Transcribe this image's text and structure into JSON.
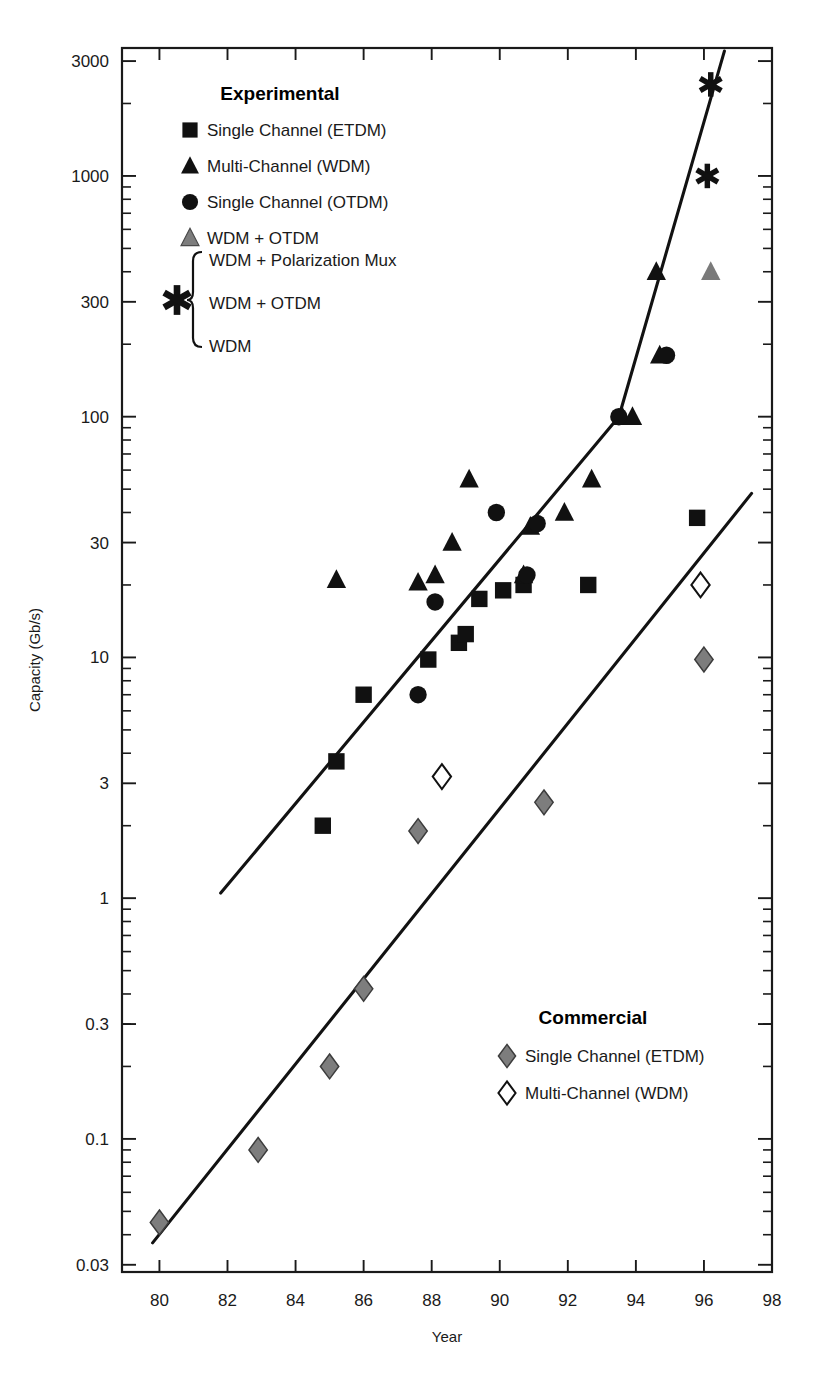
{
  "chart_data": {
    "type": "scatter",
    "title": "",
    "xlabel": "Year",
    "ylabel": "Capacity (Gb/s)",
    "yscale": "log",
    "xlim": [
      78.9,
      98
    ],
    "ylim": [
      0.028,
      3400
    ],
    "grid": false,
    "xticks": [
      "80",
      "82",
      "84",
      "86",
      "88",
      "90",
      "92",
      "94",
      "96",
      "98"
    ],
    "xtick_values": [
      80,
      82,
      84,
      86,
      88,
      90,
      92,
      94,
      96,
      98
    ],
    "yticks": [
      "0.03",
      "0.1",
      "0.3",
      "1",
      "3",
      "10",
      "30",
      "100",
      "300",
      "1000",
      "3000"
    ],
    "ytick_values": [
      0.03,
      0.1,
      0.3,
      1,
      3,
      10,
      30,
      100,
      300,
      1000,
      3000
    ],
    "legend_position": "upper-left and lower-right",
    "series": [
      {
        "name": "Single Channel (ETDM)",
        "group": "Experimental",
        "marker": "square",
        "fill": "#111111",
        "points": [
          {
            "x": 84.8,
            "y": 2.0
          },
          {
            "x": 85.2,
            "y": 3.7
          },
          {
            "x": 86.0,
            "y": 7.0
          },
          {
            "x": 87.9,
            "y": 9.8
          },
          {
            "x": 88.8,
            "y": 11.5
          },
          {
            "x": 89.0,
            "y": 12.5
          },
          {
            "x": 89.4,
            "y": 17.5
          },
          {
            "x": 90.1,
            "y": 19.0
          },
          {
            "x": 90.7,
            "y": 20.0
          },
          {
            "x": 92.6,
            "y": 20.0
          },
          {
            "x": 95.8,
            "y": 38.0
          }
        ]
      },
      {
        "name": "Multi-Channel (WDM)",
        "group": "Experimental",
        "marker": "triangle",
        "fill": "#111111",
        "points": [
          {
            "x": 85.2,
            "y": 21.0
          },
          {
            "x": 87.6,
            "y": 20.5
          },
          {
            "x": 88.1,
            "y": 22.0
          },
          {
            "x": 88.6,
            "y": 30.0
          },
          {
            "x": 89.1,
            "y": 55.0
          },
          {
            "x": 90.7,
            "y": 22.0
          },
          {
            "x": 90.9,
            "y": 35.0
          },
          {
            "x": 91.9,
            "y": 40.0
          },
          {
            "x": 92.7,
            "y": 55.0
          },
          {
            "x": 93.6,
            "y": 100.0
          },
          {
            "x": 93.9,
            "y": 100.0
          },
          {
            "x": 94.6,
            "y": 400.0
          },
          {
            "x": 94.7,
            "y": 180.0
          }
        ]
      },
      {
        "name": "Single Channel (OTDM)",
        "group": "Experimental",
        "marker": "circle",
        "fill": "#111111",
        "points": [
          {
            "x": 87.6,
            "y": 7.0
          },
          {
            "x": 88.1,
            "y": 17.0
          },
          {
            "x": 89.9,
            "y": 40.0
          },
          {
            "x": 90.8,
            "y": 22.0
          },
          {
            "x": 91.1,
            "y": 36.0
          },
          {
            "x": 93.5,
            "y": 100.0
          },
          {
            "x": 94.9,
            "y": 180.0
          }
        ]
      },
      {
        "name": "WDM + OTDM",
        "group": "Experimental",
        "marker": "triangle",
        "fill": "#7a7a7a",
        "points": [
          {
            "x": 96.2,
            "y": 400.0
          }
        ]
      },
      {
        "name": "WDM + Polarization Mux / WDM + OTDM / WDM",
        "group": "Experimental",
        "marker": "star",
        "fill": "#111111",
        "points": [
          {
            "x": 96.2,
            "y": 2400.0
          },
          {
            "x": 96.1,
            "y": 1000.0
          }
        ]
      },
      {
        "name": "Single Channel (ETDM)",
        "group": "Commercial",
        "marker": "diamond",
        "fill": "#7d7d7d",
        "points": [
          {
            "x": 80.0,
            "y": 0.045
          },
          {
            "x": 82.9,
            "y": 0.09
          },
          {
            "x": 85.0,
            "y": 0.2
          },
          {
            "x": 86.0,
            "y": 0.42
          },
          {
            "x": 87.6,
            "y": 1.9
          },
          {
            "x": 91.3,
            "y": 2.5
          },
          {
            "x": 96.0,
            "y": 9.8
          }
        ]
      },
      {
        "name": "Multi-Channel (WDM)",
        "group": "Commercial",
        "marker": "diamond-open",
        "fill": "#ffffff",
        "points": [
          {
            "x": 88.3,
            "y": 3.2
          },
          {
            "x": 95.9,
            "y": 20.0
          }
        ]
      }
    ],
    "trend_lines": [
      {
        "name": "experimental-trend",
        "segments": [
          {
            "x1": 81.8,
            "y1": 1.05,
            "x2": 93.5,
            "y2": 100.0
          },
          {
            "x1": 93.5,
            "y1": 100.0,
            "x2": 96.6,
            "y2": 3300.0
          }
        ]
      },
      {
        "name": "commercial-trend",
        "segments": [
          {
            "x1": 79.8,
            "y1": 0.037,
            "x2": 97.4,
            "y2": 48.0
          }
        ]
      }
    ]
  },
  "legend_experimental": {
    "title": "Experimental",
    "items": [
      {
        "marker": "square",
        "label": "Single Channel (ETDM)"
      },
      {
        "marker": "triangle",
        "label": "Multi-Channel (WDM)"
      },
      {
        "marker": "circle",
        "label": "Single Channel (OTDM)"
      },
      {
        "marker": "triangle-gray",
        "label": "WDM + OTDM"
      }
    ],
    "star_group": {
      "marker": "star",
      "lines": [
        "WDM + Polarization Mux",
        "WDM + OTDM",
        "WDM"
      ]
    }
  },
  "legend_commercial": {
    "title": "Commercial",
    "items": [
      {
        "marker": "diamond-gray",
        "label": "Single Channel (ETDM)"
      },
      {
        "marker": "diamond-open",
        "label": "Multi-Channel (WDM)"
      }
    ]
  },
  "axes": {
    "x_title": "Year",
    "y_title": "Capacity (Gb/s)"
  },
  "colors": {
    "ink": "#111111",
    "gray_marker": "#7d7d7d",
    "axis": "#1a1a1a"
  }
}
